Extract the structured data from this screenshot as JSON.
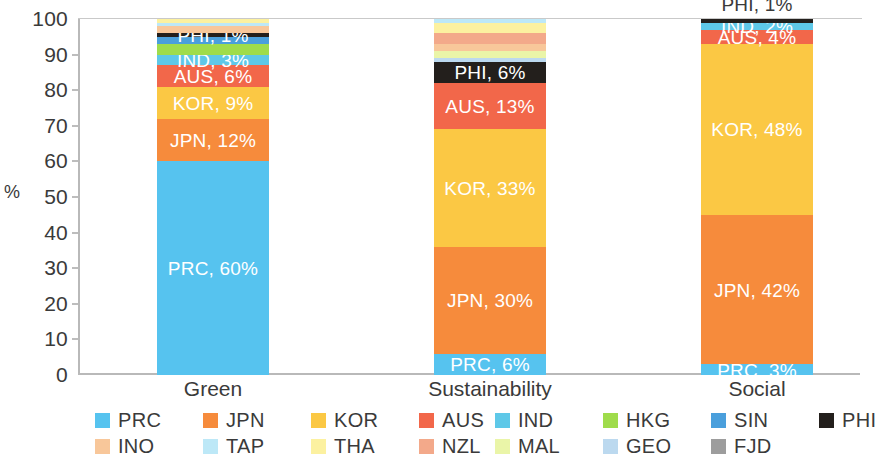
{
  "chart_data": {
    "type": "bar",
    "subtype": "stacked-100-percent",
    "title": "",
    "xlabel": "",
    "ylabel": "%",
    "ylim": [
      0,
      100
    ],
    "ytick_labels": [
      "100",
      "90",
      "80",
      "70",
      "60",
      "50",
      "40",
      "30",
      "20",
      "10",
      "0"
    ],
    "ytick_values": [
      100,
      90,
      80,
      70,
      60,
      50,
      40,
      30,
      20,
      10,
      0
    ],
    "grid": false,
    "legend_position": "bottom",
    "categories": [
      "Green",
      "Sustainability",
      "Social"
    ],
    "series": [
      {
        "name": "PRC",
        "color": "#56c3ef",
        "values": [
          60,
          6,
          3
        ]
      },
      {
        "name": "JPN",
        "color": "#f68b3c",
        "values": [
          12,
          30,
          42
        ]
      },
      {
        "name": "KOR",
        "color": "#fbc844",
        "values": [
          9,
          33,
          48
        ]
      },
      {
        "name": "AUS",
        "color": "#f2674a",
        "values": [
          6,
          13,
          4
        ]
      },
      {
        "name": "IND",
        "color": "#5ec8e8",
        "values": [
          3,
          0,
          2
        ]
      },
      {
        "name": "HKG",
        "color": "#9fdc4b",
        "values": [
          3,
          0,
          0
        ]
      },
      {
        "name": "SIN",
        "color": "#4a9fdc",
        "values": [
          2,
          0,
          0
        ]
      },
      {
        "name": "PHI",
        "color": "#231f1c",
        "values": [
          1,
          6,
          1
        ]
      },
      {
        "name": "INO",
        "color": "#f8c79a",
        "values": [
          2,
          2,
          0
        ]
      },
      {
        "name": "TAP",
        "color": "#bde8f7",
        "values": [
          1,
          1,
          0
        ]
      },
      {
        "name": "THA",
        "color": "#fcf1a0",
        "values": [
          1,
          3,
          0
        ]
      },
      {
        "name": "NZL",
        "color": "#f3a98a",
        "values": [
          0,
          3,
          0
        ]
      },
      {
        "name": "MAL",
        "color": "#eaf5a8",
        "values": [
          0,
          2,
          0
        ]
      },
      {
        "name": "GEO",
        "color": "#bcd9ef",
        "values": [
          0,
          1,
          0
        ]
      },
      {
        "name": "FJD",
        "color": "#9d9d9d",
        "values": [
          0,
          0,
          0
        ]
      }
    ],
    "data_labels": {
      "Green": [
        {
          "series": "PRC",
          "text": "PRC, 60%"
        },
        {
          "series": "JPN",
          "text": "JPN, 12%"
        },
        {
          "series": "KOR",
          "text": "KOR, 9%"
        },
        {
          "series": "AUS",
          "text": "AUS, 6%"
        },
        {
          "series": "IND",
          "text": "IND, 3%"
        },
        {
          "series": "PHI",
          "text": "PHI, 1%"
        }
      ],
      "Sustainability": [
        {
          "series": "PRC",
          "text": "PRC, 6%"
        },
        {
          "series": "JPN",
          "text": "JPN, 30%"
        },
        {
          "series": "KOR",
          "text": "KOR, 33%"
        },
        {
          "series": "AUS",
          "text": "AUS, 13%"
        },
        {
          "series": "PHI",
          "text": "PHI, 6%"
        }
      ],
      "Social": [
        {
          "series": "PRC",
          "text": "PRC, 3%"
        },
        {
          "series": "JPN",
          "text": "JPN, 42%"
        },
        {
          "series": "KOR",
          "text": "KOR, 48%"
        },
        {
          "series": "AUS",
          "text": "AUS, 4%"
        },
        {
          "series": "IND",
          "text": "IND, 2%"
        },
        {
          "series": "PHI",
          "text": "PHI, 1%"
        }
      ]
    }
  },
  "axis": {
    "y_title": "%",
    "y_ticks": [
      "100",
      "90",
      "80",
      "70",
      "60",
      "50",
      "40",
      "30",
      "20",
      "10",
      "0"
    ],
    "x_ticks": [
      "Green",
      "Sustainability",
      "Social"
    ]
  },
  "bars": [
    {
      "category": "Green",
      "segments": [
        {
          "name": "PRC",
          "value": 60,
          "color": "#56c3ef",
          "label": "PRC, 60%",
          "label_pos": "inside",
          "label_color": "light"
        },
        {
          "name": "JPN",
          "value": 12,
          "color": "#f68b3c",
          "label": "JPN, 12%",
          "label_pos": "inside",
          "label_color": "light"
        },
        {
          "name": "KOR",
          "value": 9,
          "color": "#fbc844",
          "label": "KOR, 9%",
          "label_pos": "inside",
          "label_color": "light"
        },
        {
          "name": "AUS",
          "value": 6,
          "color": "#f2674a",
          "label": "AUS, 6%",
          "label_pos": "inside",
          "label_color": "light"
        },
        {
          "name": "IND",
          "value": 3,
          "color": "#5ec8e8",
          "label": "IND, 3%",
          "label_pos": "inside",
          "label_color": "light"
        },
        {
          "name": "HKG",
          "value": 3,
          "color": "#9fdc4b",
          "label": "",
          "label_pos": "none",
          "label_color": "light"
        },
        {
          "name": "SIN",
          "value": 2,
          "color": "#4a9fdc",
          "label": "",
          "label_pos": "none",
          "label_color": "light"
        },
        {
          "name": "PHI",
          "value": 1,
          "color": "#231f1c",
          "label": "PHI, 1%",
          "label_pos": "inside",
          "label_color": "light"
        },
        {
          "name": "INO",
          "value": 2,
          "color": "#f8c79a",
          "label": "",
          "label_pos": "none",
          "label_color": "light"
        },
        {
          "name": "TAP",
          "value": 1,
          "color": "#bde8f7",
          "label": "",
          "label_pos": "none",
          "label_color": "light"
        },
        {
          "name": "THA",
          "value": 1,
          "color": "#fcf1a0",
          "label": "",
          "label_pos": "none",
          "label_color": "light"
        }
      ]
    },
    {
      "category": "Sustainability",
      "segments": [
        {
          "name": "PRC",
          "value": 6,
          "color": "#56c3ef",
          "label": "PRC, 6%",
          "label_pos": "inside",
          "label_color": "light"
        },
        {
          "name": "JPN",
          "value": 30,
          "color": "#f68b3c",
          "label": "JPN, 30%",
          "label_pos": "inside",
          "label_color": "light"
        },
        {
          "name": "KOR",
          "value": 33,
          "color": "#fbc844",
          "label": "KOR, 33%",
          "label_pos": "inside",
          "label_color": "light"
        },
        {
          "name": "AUS",
          "value": 13,
          "color": "#f2674a",
          "label": "AUS, 13%",
          "label_pos": "inside",
          "label_color": "light"
        },
        {
          "name": "PHI",
          "value": 6,
          "color": "#231f1c",
          "label": "PHI, 6%",
          "label_pos": "inside",
          "label_color": "light"
        },
        {
          "name": "GEO",
          "value": 1,
          "color": "#bcd9ef",
          "label": "",
          "label_pos": "none",
          "label_color": "light"
        },
        {
          "name": "MAL",
          "value": 2,
          "color": "#eaf5a8",
          "label": "",
          "label_pos": "none",
          "label_color": "light"
        },
        {
          "name": "INO",
          "value": 2,
          "color": "#f8c79a",
          "label": "",
          "label_pos": "none",
          "label_color": "light"
        },
        {
          "name": "NZL",
          "value": 3,
          "color": "#f3a98a",
          "label": "",
          "label_pos": "none",
          "label_color": "light"
        },
        {
          "name": "THA",
          "value": 3,
          "color": "#fcf1a0",
          "label": "",
          "label_pos": "none",
          "label_color": "light"
        },
        {
          "name": "TAP",
          "value": 1,
          "color": "#bde8f7",
          "label": "",
          "label_pos": "none",
          "label_color": "light"
        }
      ]
    },
    {
      "category": "Social",
      "segments": [
        {
          "name": "PRC",
          "value": 3,
          "color": "#56c3ef",
          "label": "PRC, 3%",
          "label_pos": "inside",
          "label_color": "light"
        },
        {
          "name": "JPN",
          "value": 42,
          "color": "#f68b3c",
          "label": "JPN, 42%",
          "label_pos": "inside",
          "label_color": "light"
        },
        {
          "name": "KOR",
          "value": 48,
          "color": "#fbc844",
          "label": "KOR, 48%",
          "label_pos": "inside",
          "label_color": "light"
        },
        {
          "name": "AUS",
          "value": 4,
          "color": "#f2674a",
          "label": "AUS, 4%",
          "label_pos": "inside",
          "label_color": "light"
        },
        {
          "name": "IND",
          "value": 2,
          "color": "#5ec8e8",
          "label": "IND, 2%",
          "label_pos": "inside",
          "label_color": "light"
        },
        {
          "name": "PHI",
          "value": 1,
          "color": "#231f1c",
          "label": "PHI, 1%",
          "label_pos": "above",
          "label_color": "dark"
        }
      ]
    }
  ],
  "legend": {
    "items": [
      {
        "label": "PRC",
        "color": "#56c3ef"
      },
      {
        "label": "JPN",
        "color": "#f68b3c"
      },
      {
        "label": "KOR",
        "color": "#fbc844"
      },
      {
        "label": "AUS",
        "color": "#f2674a"
      },
      {
        "label": "IND",
        "color": "#5ec8e8"
      },
      {
        "label": "HKG",
        "color": "#9fdc4b"
      },
      {
        "label": "SIN",
        "color": "#4a9fdc"
      },
      {
        "label": "PHI",
        "color": "#231f1c"
      },
      {
        "label": "INO",
        "color": "#f8c79a"
      },
      {
        "label": "TAP",
        "color": "#bde8f7"
      },
      {
        "label": "THA",
        "color": "#fcf1a0"
      },
      {
        "label": "NZL",
        "color": "#f3a98a"
      },
      {
        "label": "MAL",
        "color": "#eaf5a8"
      },
      {
        "label": "GEO",
        "color": "#bcd9ef"
      },
      {
        "label": "FJD",
        "color": "#9d9d9d"
      }
    ]
  }
}
